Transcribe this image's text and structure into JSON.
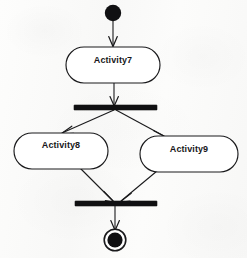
{
  "diagram": {
    "type": "uml-activity-diagram",
    "background_color": "#fbfbfa",
    "stroke_color": "#1a1a1c",
    "fill_color": "#ffffff",
    "nodes": [
      {
        "id": "initial",
        "kind": "initial-node",
        "label": "",
        "cx": 113,
        "cy": 13,
        "r": 8,
        "fill": "#101012"
      },
      {
        "id": "activity7",
        "kind": "action-node",
        "label": "Activity7",
        "x": 66,
        "y": 47,
        "width": 94,
        "height": 36,
        "label_cx": 113,
        "label_cy": 60
      },
      {
        "id": "fork",
        "kind": "fork-bar",
        "label": "",
        "x": 74,
        "y": 105,
        "width": 83,
        "height": 5,
        "fill": "#101012"
      },
      {
        "id": "activity8",
        "kind": "action-node",
        "label": "Activity8",
        "x": 14,
        "y": 133,
        "width": 94,
        "height": 36,
        "label_cx": 61,
        "label_cy": 145
      },
      {
        "id": "activity9",
        "kind": "action-node",
        "label": "Activity9",
        "x": 140,
        "y": 136,
        "width": 98,
        "height": 36,
        "label_cx": 189,
        "label_cy": 149
      },
      {
        "id": "join",
        "kind": "join-bar",
        "label": "",
        "x": 75,
        "y": 201,
        "width": 82,
        "height": 5,
        "fill": "#101012"
      },
      {
        "id": "final",
        "kind": "final-node",
        "label": "",
        "cx": 115,
        "cy": 240,
        "outer_r": 11,
        "inner_r": 7.5,
        "fill": "#101012"
      }
    ],
    "edges": [
      {
        "id": "e1",
        "from": "initial",
        "to": "activity7",
        "kind": "control-flow"
      },
      {
        "id": "e2",
        "from": "activity7",
        "to": "fork",
        "kind": "control-flow"
      },
      {
        "id": "e3",
        "from": "fork",
        "to": "activity8",
        "kind": "control-flow"
      },
      {
        "id": "e4",
        "from": "fork",
        "to": "activity9",
        "kind": "control-flow"
      },
      {
        "id": "e5",
        "from": "activity8",
        "to": "join",
        "kind": "control-flow"
      },
      {
        "id": "e6",
        "from": "activity9",
        "to": "join",
        "kind": "control-flow"
      },
      {
        "id": "e7",
        "from": "join",
        "to": "final",
        "kind": "control-flow"
      }
    ]
  }
}
